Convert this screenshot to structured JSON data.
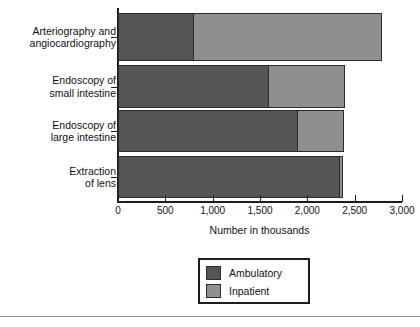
{
  "chart_data": {
    "type": "bar",
    "orientation": "horizontal",
    "stacked": true,
    "title": "",
    "xlabel": "Number in thousands",
    "ylabel": "",
    "xlim": [
      0,
      3000
    ],
    "grid": false,
    "legend_position": "bottom-center",
    "categories": [
      "Arteriography and\nangiocardiography",
      "Endoscopy of\nsmall intestine",
      "Endoscopy of\nlarge intestine",
      "Extraction\nof lens"
    ],
    "xticks": [
      0,
      500,
      1000,
      1500,
      2000,
      2500,
      3000
    ],
    "xticklabels": [
      "0",
      "500",
      "1,000",
      "1,500",
      "2,000",
      "2,500",
      "3,000"
    ],
    "series": [
      {
        "name": "Ambulatory",
        "color": "#565656",
        "values": [
          800,
          1590,
          1900,
          2340
        ]
      },
      {
        "name": "Inpatient",
        "color": "#8f8f8f",
        "values": [
          2000,
          820,
          500,
          50
        ]
      }
    ],
    "totals": [
      2800,
      2410,
      2400,
      2390
    ]
  },
  "legend": {
    "items": [
      {
        "label": "Ambulatory",
        "color": "#565656"
      },
      {
        "label": "Inpatient",
        "color": "#8f8f8f"
      }
    ]
  },
  "colors": {
    "ambulatory": "#565656",
    "inpatient": "#8f8f8f",
    "axis": "#1d1d1d",
    "text": "#111111",
    "rule": "#8d8d8d",
    "background": "#ffffff"
  }
}
